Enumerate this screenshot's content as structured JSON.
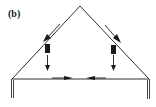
{
  "figure": {
    "label": "(b)",
    "colors": {
      "line": "#1a1a1a",
      "background": "#ffffff"
    },
    "elements": {
      "apex": [
        80,
        6
      ],
      "left_eave": [
        12,
        79
      ],
      "right_eave": [
        149,
        79
      ],
      "tie_beam_y": 79,
      "left_post_x": 12,
      "right_post_x": 148,
      "post_bottom_y": 98
    },
    "arrows": [
      {
        "name": "left-rafter-arrow",
        "direction": "down-left"
      },
      {
        "name": "left-vertical-arrow",
        "direction": "down"
      },
      {
        "name": "right-rafter-arrow",
        "direction": "down-right"
      },
      {
        "name": "right-vertical-arrow",
        "direction": "down"
      },
      {
        "name": "left-tie-arrow",
        "direction": "right"
      },
      {
        "name": "right-tie-arrow",
        "direction": "left"
      }
    ]
  }
}
